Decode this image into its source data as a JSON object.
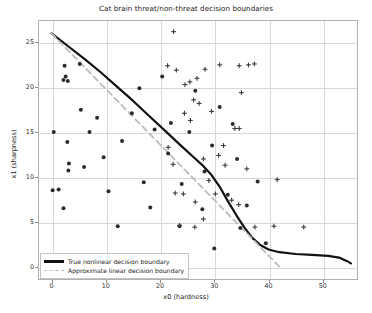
{
  "chart_data": {
    "type": "scatter",
    "title": "Cat brain threat/non-threat decision boundaries",
    "xlabel": "x0 (hardness)",
    "ylabel": "x1 (sharpness)",
    "xlim": [
      -2.5,
      56.5
    ],
    "ylim": [
      -1.5,
      27.5
    ],
    "xticks": [
      0,
      10,
      20,
      30,
      40,
      50
    ],
    "yticks": [
      0,
      5,
      10,
      15,
      20,
      25
    ],
    "grid": true,
    "legend_position": "lower left",
    "series": [
      {
        "name": "non-threat",
        "marker": "dot",
        "color": "#2b2b2b",
        "points": [
          [
            0.4,
            15.0
          ],
          [
            0.2,
            8.5
          ],
          [
            1.3,
            8.6
          ],
          [
            2.4,
            22.4
          ],
          [
            2.6,
            21.2
          ],
          [
            2.2,
            20.8
          ],
          [
            3.0,
            20.7
          ],
          [
            2.9,
            13.9
          ],
          [
            3.2,
            11.5
          ],
          [
            3.1,
            10.7
          ],
          [
            2.2,
            6.5
          ],
          [
            5.2,
            22.6
          ],
          [
            5.4,
            17.5
          ],
          [
            6.0,
            11.1
          ],
          [
            7.0,
            15.0
          ],
          [
            8.4,
            16.6
          ],
          [
            9.6,
            12.2
          ],
          [
            10.5,
            8.4
          ],
          [
            12.2,
            4.5
          ],
          [
            13.0,
            14.0
          ],
          [
            14.8,
            17.1
          ],
          [
            16.2,
            19.9
          ],
          [
            17.0,
            9.4
          ],
          [
            18.2,
            6.6
          ],
          [
            19.0,
            15.3
          ],
          [
            20.4,
            21.2
          ],
          [
            21.5,
            12.6
          ],
          [
            22.0,
            16.0
          ],
          [
            23.6,
            4.5
          ],
          [
            24.0,
            9.2
          ],
          [
            25.4,
            15.0
          ],
          [
            26.5,
            19.6
          ],
          [
            27.8,
            6.4
          ],
          [
            28.2,
            10.6
          ],
          [
            29.6,
            13.5
          ],
          [
            31.0,
            17.8
          ],
          [
            32.5,
            8.0
          ],
          [
            33.4,
            15.9
          ],
          [
            34.2,
            12.0
          ],
          [
            34.8,
            4.3
          ],
          [
            36.0,
            6.8
          ],
          [
            38.0,
            9.5
          ],
          [
            39.5,
            2.6
          ],
          [
            30.0,
            2.0
          ]
        ]
      },
      {
        "name": "threat",
        "marker": "plus",
        "color": "#3a3a3a",
        "points": [
          [
            22.5,
            26.2
          ],
          [
            21.4,
            22.4
          ],
          [
            23.0,
            21.9
          ],
          [
            25.5,
            20.6
          ],
          [
            26.8,
            21.0
          ],
          [
            24.6,
            20.3
          ],
          [
            26.2,
            18.6
          ],
          [
            28.3,
            22.0
          ],
          [
            31.0,
            22.5
          ],
          [
            34.6,
            22.4
          ],
          [
            36.3,
            22.5
          ],
          [
            37.4,
            22.6
          ],
          [
            24.5,
            17.1
          ],
          [
            25.6,
            16.3
          ],
          [
            33.8,
            15.4
          ],
          [
            34.6,
            15.4
          ],
          [
            28.0,
            12.0
          ],
          [
            36.0,
            10.9
          ],
          [
            41.6,
            9.7
          ],
          [
            30.2,
            8.1
          ],
          [
            22.8,
            8.2
          ],
          [
            24.3,
            8.1
          ],
          [
            26.5,
            7.2
          ],
          [
            23.6,
            4.6
          ],
          [
            26.4,
            4.4
          ],
          [
            27.2,
            18.2
          ],
          [
            29.5,
            17.3
          ],
          [
            30.8,
            12.4
          ],
          [
            32.0,
            11.3
          ],
          [
            31.7,
            13.5
          ],
          [
            34.5,
            6.9
          ],
          [
            37.5,
            4.4
          ],
          [
            41.0,
            4.5
          ],
          [
            46.5,
            4.4
          ],
          [
            28.0,
            5.3
          ],
          [
            22.4,
            11.4
          ],
          [
            21.5,
            13.3
          ],
          [
            35.0,
            19.4
          ],
          [
            33.2,
            7.4
          ],
          [
            29.0,
            9.6
          ]
        ]
      }
    ],
    "lines": [
      {
        "name": "True nonlinear decision boundary",
        "label": "True nonlinear decision boundary",
        "style": "solid",
        "color": "#111111",
        "width": 2.2,
        "points": [
          [
            0.0,
            26.0
          ],
          [
            3.0,
            24.6
          ],
          [
            6.0,
            23.2
          ],
          [
            9.0,
            21.7
          ],
          [
            12.0,
            20.1
          ],
          [
            15.0,
            18.5
          ],
          [
            18.0,
            16.8
          ],
          [
            21.0,
            15.1
          ],
          [
            24.0,
            13.4
          ],
          [
            26.0,
            12.3
          ],
          [
            28.0,
            11.2
          ],
          [
            29.5,
            10.2
          ],
          [
            31.0,
            8.9
          ],
          [
            32.5,
            7.3
          ],
          [
            34.0,
            5.8
          ],
          [
            35.5,
            4.4
          ],
          [
            37.0,
            3.2
          ],
          [
            38.5,
            2.4
          ],
          [
            40.0,
            1.9
          ],
          [
            42.0,
            1.6
          ],
          [
            45.0,
            1.4
          ],
          [
            48.0,
            1.3
          ],
          [
            51.0,
            1.2
          ],
          [
            53.0,
            1.0
          ],
          [
            54.5,
            0.6
          ],
          [
            55.2,
            0.35
          ]
        ]
      },
      {
        "name": "Approximate linear decision boundary",
        "label": "Approximate linear decision boundary",
        "style": "dashed",
        "color": "#bcbcbc",
        "width": 1.8,
        "points": [
          [
            0.0,
            26.0
          ],
          [
            42.0,
            0.0
          ]
        ]
      }
    ]
  }
}
